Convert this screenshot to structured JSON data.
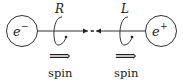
{
  "diagram": {
    "left_particle": {
      "symbol": "e",
      "superscript": "−",
      "label": "e⁻"
    },
    "right_particle": {
      "symbol": "e",
      "superscript": "+",
      "label": "e⁺"
    },
    "left_helicity": "R",
    "right_helicity": "L",
    "left_spin_arrow": "⟹",
    "right_spin_arrow": "⟹",
    "left_spin_label": "spin",
    "right_spin_label": "spin"
  }
}
